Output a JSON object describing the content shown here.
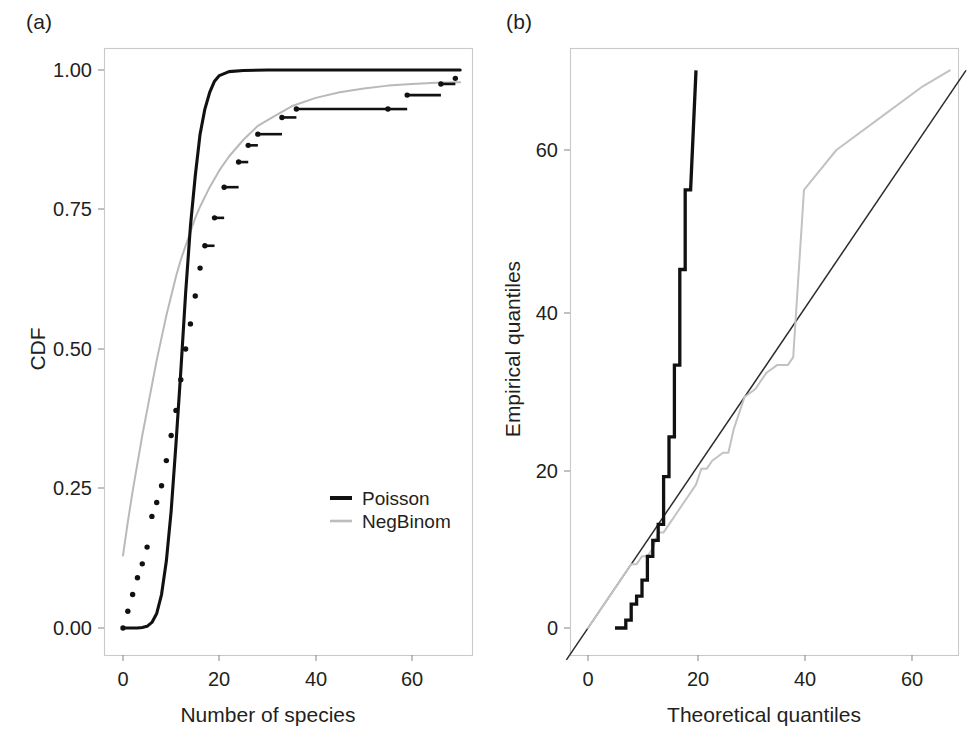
{
  "figure": {
    "panel_a_label": "(a)",
    "panel_b_label": "(b)"
  },
  "chart_data": [
    {
      "type": "line",
      "panel": "(a)",
      "title": "",
      "xlabel": "Number of species",
      "ylabel": "CDF",
      "xlim": [
        -3,
        72
      ],
      "ylim": [
        -0.05,
        1.06
      ],
      "xticks": [
        0,
        20,
        40,
        60
      ],
      "xticklabels": [
        "0",
        "20",
        "40",
        "60"
      ],
      "yticks": [
        0.0,
        0.25,
        0.5,
        0.75,
        1.0
      ],
      "yticklabels": [
        "0.00",
        "0.25",
        "0.50",
        "0.75",
        "1.00"
      ],
      "grid": false,
      "legend_position": "center-right",
      "legend": [
        "Poisson",
        "NegBinom"
      ],
      "colors": {
        "poisson": "#111111",
        "negbinom": "#b9b9b9",
        "ecdf": "#111111"
      },
      "series": [
        {
          "name": "Poisson",
          "style": "solid-thick-black",
          "x": [
            0,
            1,
            2,
            3,
            4,
            5,
            6,
            7,
            8,
            9,
            10,
            11,
            12,
            13,
            14,
            15,
            16,
            17,
            18,
            19,
            20,
            22,
            25,
            30,
            40,
            50,
            60,
            70
          ],
          "y": [
            0.0,
            0.0,
            0.0,
            0.0,
            0.001,
            0.003,
            0.01,
            0.026,
            0.06,
            0.12,
            0.21,
            0.33,
            0.46,
            0.6,
            0.72,
            0.81,
            0.885,
            0.93,
            0.96,
            0.98,
            0.99,
            0.997,
            0.999,
            1.0,
            1.0,
            1.0,
            1.0,
            1.0
          ]
        },
        {
          "name": "NegBinom",
          "style": "solid-thin-gray",
          "x": [
            0,
            1,
            2,
            3,
            4,
            5,
            6,
            7,
            8,
            9,
            10,
            11,
            12,
            13,
            14,
            15,
            16,
            18,
            20,
            22,
            25,
            28,
            31,
            35,
            40,
            45,
            50,
            55,
            60,
            65,
            70
          ],
          "y": [
            0.13,
            0.19,
            0.245,
            0.295,
            0.345,
            0.39,
            0.435,
            0.48,
            0.52,
            0.56,
            0.595,
            0.63,
            0.66,
            0.685,
            0.71,
            0.735,
            0.755,
            0.79,
            0.82,
            0.845,
            0.875,
            0.9,
            0.915,
            0.935,
            0.95,
            0.96,
            0.967,
            0.972,
            0.975,
            0.977,
            0.978
          ]
        },
        {
          "name": "Empirical CDF",
          "style": "step-dotted-black",
          "x": [
            0,
            1,
            2,
            3,
            4,
            5,
            6,
            7,
            8,
            9,
            10,
            11,
            12,
            13,
            14,
            15,
            16,
            17,
            19,
            21,
            24,
            26,
            28,
            33,
            36,
            55,
            59,
            66,
            69
          ],
          "y": [
            0.0,
            0.03,
            0.06,
            0.09,
            0.115,
            0.145,
            0.2,
            0.225,
            0.255,
            0.3,
            0.345,
            0.39,
            0.445,
            0.5,
            0.545,
            0.595,
            0.645,
            0.685,
            0.735,
            0.79,
            0.835,
            0.865,
            0.885,
            0.915,
            0.93,
            0.93,
            0.955,
            0.975,
            0.985
          ]
        }
      ]
    },
    {
      "type": "scatter",
      "panel": "(b)",
      "title": "",
      "xlabel": "Theoretical quantiles",
      "ylabel": "Empirical quantiles",
      "xlim": [
        -5,
        72
      ],
      "ylim": [
        -5,
        74
      ],
      "xticks": [
        0,
        20,
        40,
        60
      ],
      "xticklabels": [
        "0",
        "20",
        "40",
        "60"
      ],
      "yticks": [
        0,
        20,
        40,
        60
      ],
      "yticklabels": [
        "0",
        "20",
        "40",
        "60"
      ],
      "grid": false,
      "legend_position": "none",
      "legend": [],
      "colors": {
        "poisson": "#111111",
        "negbinom": "#c2c2c2",
        "reference": "#2b2b2b"
      },
      "series": [
        {
          "name": "reference line y = x",
          "style": "solid-thin-dark",
          "x": [
            -4,
            70
          ],
          "y": [
            -4,
            70
          ]
        },
        {
          "name": "Poisson",
          "style": "step-thick-black",
          "x": [
            5,
            7,
            7,
            8,
            8,
            9,
            9,
            10,
            10,
            11,
            11,
            12,
            12,
            13,
            13,
            14,
            14,
            15,
            15,
            16,
            16,
            17,
            17,
            18,
            18,
            19,
            20
          ],
          "y": [
            0,
            0,
            1,
            1,
            3,
            3,
            4,
            4,
            6,
            6,
            9,
            9,
            11,
            11,
            13,
            13,
            19,
            19,
            24,
            24,
            33,
            33,
            45,
            45,
            55,
            55,
            70
          ]
        },
        {
          "name": "NegBinom",
          "style": "solid-thin-gray",
          "x": [
            0,
            2,
            4,
            6,
            8,
            9,
            10,
            11,
            12,
            13,
            14,
            15,
            16,
            18,
            20,
            21,
            22,
            23,
            25,
            26,
            27,
            28,
            29,
            31,
            33,
            35,
            37,
            38,
            40,
            46,
            54,
            62,
            67
          ],
          "y": [
            0,
            2,
            4,
            6,
            8,
            8,
            9,
            9,
            10,
            12,
            12,
            13,
            14,
            16,
            18,
            20,
            20,
            21,
            22,
            22,
            25,
            27,
            29,
            30,
            32,
            33,
            33,
            34,
            55,
            60,
            64,
            68,
            70
          ]
        }
      ]
    }
  ]
}
